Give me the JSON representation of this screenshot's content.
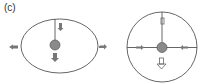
{
  "figure": {
    "panel_label": "(c)",
    "colors": {
      "stroke": "#555555",
      "ball_fill": "#888888",
      "ball_stroke": "#555555",
      "arrow_fill": "#777777",
      "background": "#ffffff"
    },
    "left_diagram": {
      "shape": "ellipse",
      "description": "Elliptical boundary with vertical line from top to central ball, small downward arrow on line, large downward arrow below ball, arrows pointing outward on left and right sides"
    },
    "right_diagram": {
      "shape": "circle",
      "description": "Circular boundary with horizontal and vertical lines crossing at central ball, inward arrows on horizontal line, small arrow on vertical line, large downward arrow below ball"
    }
  }
}
